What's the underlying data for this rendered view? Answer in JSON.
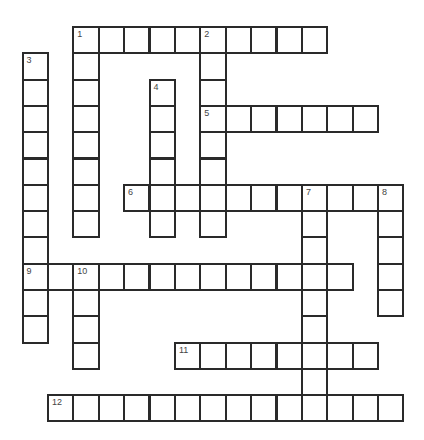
{
  "puzzle": {
    "type": "crossword",
    "grid": {
      "origin_x": 22.5,
      "origin_y": 27,
      "cell_w": 25.4,
      "cell_h": 26.3
    },
    "line_color": "#2a2a2a",
    "label_color": "#444444",
    "entries": [
      {
        "number": "1",
        "direction": "across",
        "row": 0,
        "col": 2,
        "length": 10
      },
      {
        "number": "1",
        "direction": "down",
        "row": 0,
        "col": 2,
        "length": 8
      },
      {
        "number": "2",
        "direction": "down",
        "row": 0,
        "col": 7,
        "length": 8
      },
      {
        "number": "3",
        "direction": "down",
        "row": 1,
        "col": 0,
        "length": 11
      },
      {
        "number": "4",
        "direction": "down",
        "row": 2,
        "col": 5,
        "length": 6
      },
      {
        "number": "5",
        "direction": "across",
        "row": 3,
        "col": 7,
        "length": 7
      },
      {
        "number": "6",
        "direction": "across",
        "row": 6,
        "col": 4,
        "length": 11
      },
      {
        "number": "7",
        "direction": "down",
        "row": 6,
        "col": 11,
        "length": 9
      },
      {
        "number": "8",
        "direction": "down",
        "row": 6,
        "col": 14,
        "length": 5
      },
      {
        "number": "9",
        "direction": "across",
        "row": 9,
        "col": 0,
        "length": 13
      },
      {
        "number": "10",
        "direction": "down",
        "row": 9,
        "col": 2,
        "length": 4
      },
      {
        "number": "11",
        "direction": "across",
        "row": 12,
        "col": 6,
        "length": 8
      },
      {
        "number": "12",
        "direction": "across",
        "row": 14,
        "col": 1,
        "length": 14
      }
    ]
  }
}
